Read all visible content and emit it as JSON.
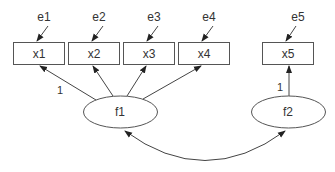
{
  "diagram": {
    "type": "structural-equation-model",
    "observed": [
      {
        "id": "x1",
        "label": "x1",
        "error": "e1"
      },
      {
        "id": "x2",
        "label": "x2",
        "error": "e2"
      },
      {
        "id": "x3",
        "label": "x3",
        "error": "e3"
      },
      {
        "id": "x4",
        "label": "x4",
        "error": "e4"
      },
      {
        "id": "x5",
        "label": "x5",
        "error": "e5"
      }
    ],
    "latent": [
      {
        "id": "f1",
        "label": "f1",
        "indicators": [
          "x1",
          "x2",
          "x3",
          "x4"
        ]
      },
      {
        "id": "f2",
        "label": "f2",
        "indicators": [
          "x5"
        ]
      }
    ],
    "loadings": [
      {
        "from": "f1",
        "to": "x1",
        "label": "1"
      },
      {
        "from": "f1",
        "to": "x2",
        "label": ""
      },
      {
        "from": "f1",
        "to": "x3",
        "label": ""
      },
      {
        "from": "f1",
        "to": "x4",
        "label": ""
      },
      {
        "from": "f2",
        "to": "x5",
        "label": "1"
      }
    ],
    "covariances": [
      {
        "between": [
          "f1",
          "f2"
        ]
      }
    ],
    "colors": {
      "stroke": "#555555",
      "text": "#333333",
      "background": "#ffffff"
    }
  }
}
